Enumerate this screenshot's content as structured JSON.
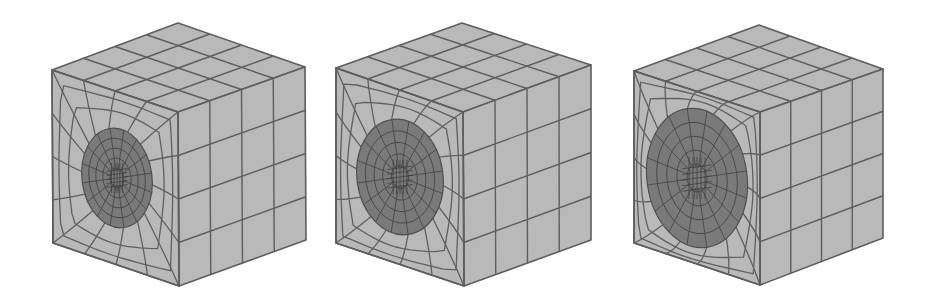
{
  "figure": {
    "title": "",
    "background": "#ffffff",
    "colors": {
      "face_fill": "#b9b9b9",
      "mesh_line": "#5e5e5e",
      "hole_fill": "#7a7a7a"
    },
    "cubes": [
      {
        "label": "cube-1",
        "top": [
          178,
          23
        ],
        "left_top": [
          52,
          70
        ],
        "right_top": [
          305,
          67
        ],
        "front_top": [
          178,
          112
        ],
        "front_bottom": [
          179,
          286
        ],
        "left_bottom": [
          53,
          243
        ],
        "right_bottom": [
          306,
          240
        ],
        "grid_divisions": 4,
        "hole": {
          "cx": 117,
          "cy": 178,
          "rx": 35,
          "ry": 50,
          "rotate": -8
        }
      },
      {
        "label": "cube-2",
        "top": [
          462,
          23
        ],
        "left_top": [
          336,
          68
        ],
        "right_top": [
          591,
          65
        ],
        "front_top": [
          463,
          112
        ],
        "front_bottom": [
          464,
          286
        ],
        "left_bottom": [
          336,
          243
        ],
        "right_bottom": [
          591,
          240
        ],
        "grid_divisions": 4,
        "hole": {
          "cx": 400,
          "cy": 177,
          "rx": 43,
          "ry": 58,
          "rotate": -8
        }
      },
      {
        "label": "cube-3",
        "top": [
          759,
          25
        ],
        "left_top": [
          634,
          71
        ],
        "right_top": [
          883,
          69
        ],
        "front_top": [
          760,
          112
        ],
        "front_bottom": [
          760,
          285
        ],
        "left_bottom": [
          634,
          243
        ],
        "right_bottom": [
          883,
          238
        ],
        "grid_divisions": 4,
        "hole": {
          "cx": 697,
          "cy": 178,
          "rx": 50,
          "ry": 70,
          "rotate": -8
        }
      }
    ]
  }
}
